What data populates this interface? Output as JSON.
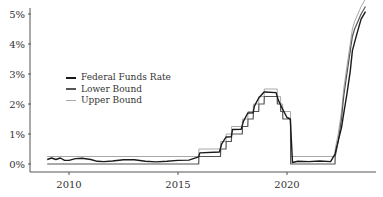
{
  "chart_data": {
    "type": "line",
    "title": "",
    "xlabel": "",
    "ylabel": "",
    "ylim": [
      0,
      5
    ],
    "xlim": [
      2008.9,
      2023.8
    ],
    "grid": false,
    "legend_position": "upper-left-center",
    "y_ticks": [
      "0%",
      "1%",
      "2%",
      "3%",
      "4%",
      "5%"
    ],
    "x_ticks": [
      "2010",
      "2015",
      "2020"
    ],
    "series": [
      {
        "name": "Federal Funds Rate",
        "color": "#1a1a1a",
        "x": [
          2009.0,
          2009.2,
          2009.4,
          2009.6,
          2009.8,
          2010.0,
          2010.3,
          2010.6,
          2011.0,
          2011.3,
          2011.6,
          2012.0,
          2012.5,
          2013.0,
          2013.5,
          2014.0,
          2014.5,
          2015.0,
          2015.5,
          2015.95,
          2016.0,
          2016.9,
          2017.0,
          2017.2,
          2017.45,
          2017.5,
          2017.9,
          2018.0,
          2018.2,
          2018.45,
          2018.5,
          2018.7,
          2018.95,
          2019.0,
          2019.5,
          2019.6,
          2019.8,
          2020.0,
          2020.15,
          2020.25,
          2020.5,
          2021.0,
          2021.5,
          2022.0,
          2022.2,
          2022.35,
          2022.5,
          2022.6,
          2022.75,
          2022.9,
          2023.0,
          2023.2,
          2023.4,
          2023.6
        ],
        "values": [
          0.15,
          0.2,
          0.15,
          0.2,
          0.12,
          0.12,
          0.18,
          0.19,
          0.15,
          0.09,
          0.08,
          0.1,
          0.14,
          0.14,
          0.09,
          0.07,
          0.09,
          0.12,
          0.13,
          0.24,
          0.37,
          0.4,
          0.66,
          0.9,
          0.91,
          1.15,
          1.16,
          1.42,
          1.7,
          1.71,
          1.92,
          2.2,
          2.4,
          2.4,
          2.38,
          2.13,
          1.83,
          1.55,
          1.5,
          0.05,
          0.09,
          0.08,
          0.1,
          0.08,
          0.33,
          0.77,
          1.21,
          1.68,
          2.33,
          3.08,
          3.78,
          4.33,
          4.83,
          5.08
        ]
      },
      {
        "name": "Lower Bound",
        "color": "#555555",
        "x": [
          2009.0,
          2015.95,
          2015.96,
          2016.95,
          2016.96,
          2017.2,
          2017.21,
          2017.45,
          2017.46,
          2017.95,
          2017.96,
          2018.2,
          2018.21,
          2018.45,
          2018.46,
          2018.7,
          2018.71,
          2018.95,
          2018.96,
          2019.55,
          2019.56,
          2019.7,
          2019.71,
          2019.8,
          2019.81,
          2020.16,
          2020.17,
          2022.2,
          2022.21,
          2022.35,
          2022.5,
          2022.6,
          2022.75,
          2022.9,
          2023.0,
          2023.1,
          2023.25,
          2023.4,
          2023.6
        ],
        "values": [
          0,
          0,
          0.25,
          0.25,
          0.5,
          0.5,
          0.75,
          0.75,
          1.0,
          1.0,
          1.25,
          1.25,
          1.5,
          1.5,
          1.75,
          1.75,
          2.0,
          2.0,
          2.25,
          2.25,
          2.0,
          2.0,
          1.75,
          1.75,
          1.5,
          1.5,
          0,
          0,
          0.25,
          0.75,
          1.5,
          2.25,
          3.0,
          3.75,
          4.25,
          4.5,
          4.75,
          5.0,
          5.25
        ]
      },
      {
        "name": "Upper Bound",
        "color": "#a8a8a8",
        "x": [
          2009.0,
          2015.95,
          2015.96,
          2016.95,
          2016.96,
          2017.2,
          2017.21,
          2017.45,
          2017.46,
          2017.95,
          2017.96,
          2018.2,
          2018.21,
          2018.45,
          2018.46,
          2018.7,
          2018.71,
          2018.95,
          2018.96,
          2019.55,
          2019.56,
          2019.7,
          2019.71,
          2019.8,
          2019.81,
          2020.16,
          2020.17,
          2022.2,
          2022.21,
          2022.35,
          2022.5,
          2022.6,
          2022.75,
          2022.9,
          2023.0,
          2023.1,
          2023.25,
          2023.4,
          2023.6
        ],
        "values": [
          0.25,
          0.25,
          0.5,
          0.5,
          0.75,
          0.75,
          1.0,
          1.0,
          1.25,
          1.25,
          1.5,
          1.5,
          1.75,
          1.75,
          2.0,
          2.0,
          2.25,
          2.25,
          2.5,
          2.5,
          2.25,
          2.25,
          2.0,
          2.0,
          1.75,
          1.75,
          0.25,
          0.25,
          0.5,
          1.0,
          1.75,
          2.5,
          3.25,
          4.0,
          4.5,
          4.75,
          5.0,
          5.25,
          5.5
        ]
      }
    ]
  },
  "legend": {
    "items": [
      {
        "label": "Federal Funds Rate",
        "color": "#1a1a1a"
      },
      {
        "label": "Lower Bound",
        "color": "#555555"
      },
      {
        "label": "Upper Bound",
        "color": "#a8a8a8"
      }
    ]
  },
  "axes": {
    "y_ticks": [
      "0%",
      "1%",
      "2%",
      "3%",
      "4%",
      "5%"
    ],
    "x_ticks": [
      "2010",
      "2015",
      "2020"
    ]
  }
}
